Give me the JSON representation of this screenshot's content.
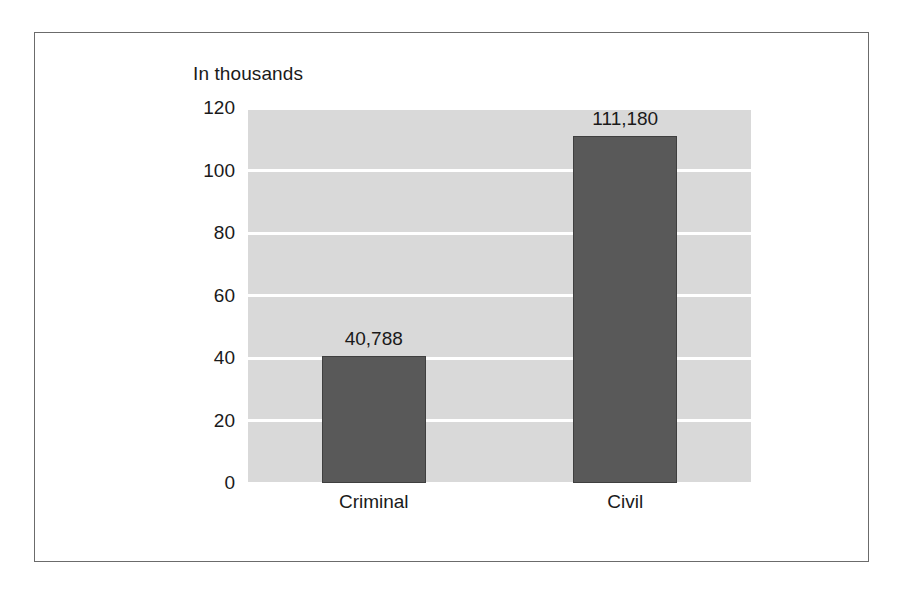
{
  "chart_data": {
    "type": "bar",
    "title": "In thousands",
    "subtitle": "",
    "xlabel": "",
    "ylabel": "",
    "categories": [
      "Criminal",
      "Civil"
    ],
    "values": [
      40.788,
      111.18
    ],
    "data_labels": [
      "40,788",
      "111,180"
    ],
    "ylim": [
      0,
      120
    ],
    "yticks": [
      0,
      20,
      40,
      60,
      80,
      100,
      120
    ],
    "ytick_labels": [
      "0",
      "20",
      "40",
      "60",
      "80",
      "100",
      "120"
    ],
    "grid": true,
    "grid_orientation": "horizontal",
    "legend": false,
    "legend_position": "none",
    "colors": {
      "bar_fill": "#595959",
      "bar_border": "#3f3f3f",
      "plot_background": "#d9d9d9",
      "gridline": "#ffffff",
      "text": "#1a1a1a",
      "frame_border": "#6b6b6b",
      "page_background": "#ffffff"
    },
    "series": [
      {
        "name": "Cases filed",
        "points": [
          {
            "category": "Criminal",
            "value": 40.788,
            "label": "40,788"
          },
          {
            "category": "Civil",
            "value": 111.18,
            "label": "111,180"
          }
        ]
      }
    ]
  }
}
